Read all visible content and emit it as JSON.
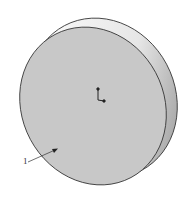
{
  "figure": {
    "reference_label": "1",
    "colors": {
      "face": "#c8c8c8",
      "edge": "#333333",
      "rim_light": "#f2f2f2",
      "rim_dark": "#8a8a8a",
      "background": "#ffffff"
    },
    "icons": [
      "origin-axis-icon",
      "leader-arrow-icon"
    ]
  }
}
